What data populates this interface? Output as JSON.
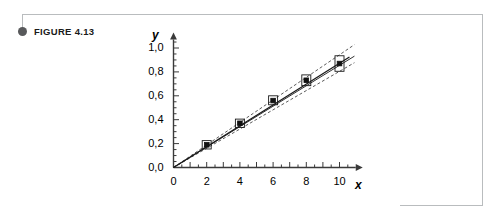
{
  "figure": {
    "caption_label": "FIGURE 4.13",
    "bullet_icon": "filled-circle-icon"
  },
  "chart_data": {
    "type": "scatter",
    "title": "",
    "subtitle": "",
    "xlabel": "x",
    "ylabel": "y",
    "xlim": [
      0,
      11.4
    ],
    "ylim": [
      0.0,
      1.08
    ],
    "grid": false,
    "legend": null,
    "x": [
      2,
      4,
      6,
      8,
      10
    ],
    "y": [
      0.19,
      0.37,
      0.56,
      0.73,
      0.87
    ],
    "y_err_low": [
      0.155,
      0.335,
      0.525,
      0.685,
      0.805
    ],
    "y_err_high": [
      0.225,
      0.405,
      0.6,
      0.775,
      0.935
    ],
    "xticks": [
      0,
      2,
      4,
      6,
      8,
      10
    ],
    "xtick_labels": [
      "0",
      "2",
      "4",
      "6",
      "8",
      "10"
    ],
    "xtick_minor_step": 0.5,
    "yticks": [
      0.0,
      0.2,
      0.4,
      0.6,
      0.8,
      1.0
    ],
    "ytick_labels": [
      "0,0",
      "0,2",
      "0,4",
      "0,6",
      "0,8",
      "1,0"
    ],
    "ytick_minor_step": 0.05,
    "series": [
      {
        "name": "data points with uncertainty boxes",
        "style": "square-marker-with-box",
        "values": [
          0.19,
          0.37,
          0.56,
          0.73,
          0.87
        ]
      },
      {
        "name": "fitted line",
        "style": "solid",
        "slope": 0.0873,
        "intercept": 0.0,
        "endpoints": [
          [
            0,
            0.0
          ],
          [
            10.6,
            0.925
          ]
        ]
      },
      {
        "name": "upper confidence band",
        "style": "dashed",
        "slope": 0.0932,
        "intercept": 0.012,
        "endpoints": [
          [
            0,
            0.0
          ],
          [
            10.9,
            1.028
          ]
        ]
      },
      {
        "name": "lower confidence band",
        "style": "dashed",
        "slope": 0.0812,
        "intercept": -0.008,
        "endpoints": [
          [
            0,
            0.0
          ],
          [
            10.9,
            0.877
          ]
        ]
      },
      {
        "name": "secondary fitted line",
        "style": "solid-thin",
        "slope": 0.0855,
        "intercept": 0.0,
        "endpoints": [
          [
            0,
            0.0
          ],
          [
            10.9,
            0.932
          ]
        ]
      }
    ],
    "annotations": []
  }
}
